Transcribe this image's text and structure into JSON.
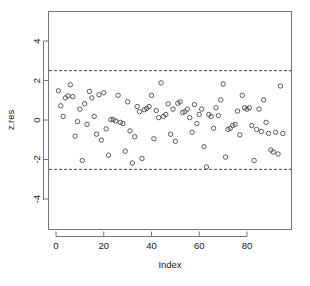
{
  "chart_data": {
    "type": "scatter",
    "title": "",
    "xlabel": "Index",
    "ylabel": "z.res",
    "xlim": [
      -2,
      98
    ],
    "ylim": [
      -5.0,
      4.9
    ],
    "xticks": [
      0,
      20,
      40,
      60,
      80
    ],
    "yticks": [
      4,
      2,
      0,
      -2,
      -4
    ],
    "xtick_labels": [
      "0",
      "20",
      "40",
      "60",
      "80"
    ],
    "ytick_labels": [
      "4",
      "2",
      "0",
      "-2",
      "-4"
    ],
    "grid": false,
    "legend": "none",
    "point_marker": "open-circle",
    "reference_lines": [
      {
        "name": "upper-bound",
        "orientation": "horizontal",
        "y": 2.5,
        "style": "dashed"
      },
      {
        "name": "lower-bound",
        "orientation": "horizontal",
        "y": -2.5,
        "style": "dashed"
      }
    ],
    "series": [
      {
        "name": "z.res",
        "x": [
          1,
          2,
          3,
          4,
          5,
          6,
          7,
          8,
          9,
          10,
          11,
          12,
          13,
          14,
          15,
          16,
          17,
          18,
          19,
          20,
          21,
          22,
          23,
          24,
          25,
          26,
          27,
          28,
          29,
          30,
          31,
          32,
          33,
          34,
          35,
          36,
          37,
          38,
          39,
          40,
          41,
          42,
          43,
          44,
          45,
          46,
          47,
          48,
          49,
          50,
          51,
          52,
          53,
          54,
          55,
          56,
          57,
          58,
          59,
          60,
          61,
          62,
          63,
          64,
          65,
          66,
          67,
          68,
          69,
          70,
          71,
          72,
          73,
          74,
          75,
          76,
          77,
          78,
          79,
          80,
          81,
          82,
          83,
          84,
          85,
          86,
          87,
          88,
          89,
          90,
          91,
          92,
          93,
          94,
          95
        ],
        "y": [
          1.48,
          0.72,
          0.18,
          1.12,
          1.22,
          1.78,
          1.18,
          -0.82,
          -0.08,
          0.55,
          -2.05,
          0.82,
          -0.22,
          1.45,
          1.12,
          0.18,
          -0.72,
          1.28,
          -1.02,
          1.38,
          -0.45,
          -1.78,
          0.02,
          0.02,
          -0.05,
          1.25,
          -0.12,
          -0.18,
          -1.58,
          0.92,
          -0.55,
          -2.18,
          -0.85,
          0.68,
          0.42,
          -1.95,
          0.52,
          0.58,
          0.68,
          1.25,
          -0.95,
          0.48,
          0.12,
          1.88,
          0.18,
          0.28,
          0.82,
          -0.72,
          0.55,
          -1.08,
          0.85,
          0.92,
          0.38,
          0.42,
          0.55,
          0.12,
          -0.62,
          0.78,
          -0.18,
          0.28,
          0.55,
          -1.35,
          -2.38,
          0.28,
          0.18,
          -0.42,
          0.62,
          0.22,
          1.02,
          1.82,
          -1.88,
          -0.48,
          -0.42,
          -0.28,
          -0.22,
          0.45,
          -0.75,
          1.25,
          0.62,
          0.55,
          0.62,
          -0.28,
          -2.05,
          -0.48,
          0.55,
          -0.58,
          1.02,
          -0.12,
          -0.68,
          -1.52,
          -1.62,
          -0.62,
          -1.72,
          1.72,
          -0.68
        ]
      }
    ]
  },
  "axes": {
    "x_axis_name": "Index",
    "y_axis_name": "z.res"
  }
}
